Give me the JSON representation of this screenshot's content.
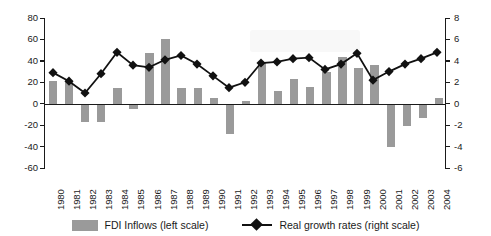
{
  "chart_data": {
    "type": "bar",
    "title": "",
    "subtitle": "",
    "xlabel": "",
    "ylabel": "",
    "grid": false,
    "legend_position": "bottom-center",
    "categories": [
      "1980",
      "1981",
      "1982",
      "1983",
      "1984",
      "1985",
      "1986",
      "1987",
      "1988",
      "1989",
      "1990",
      "1991",
      "1992",
      "1993",
      "1994",
      "1995",
      "1996",
      "1997",
      "1998",
      "1999",
      "2000",
      "2001",
      "2002",
      "2003",
      "2004"
    ],
    "axes": {
      "left": {
        "name": "FDI Inflows (left scale)",
        "ylim": [
          -60,
          80
        ],
        "ticks": [
          80,
          60,
          40,
          20,
          0,
          -20,
          -40,
          -60
        ],
        "tick_labels": [
          "80",
          "60",
          "40",
          "20",
          "0",
          "-20",
          "-40",
          "-60"
        ]
      },
      "right": {
        "name": "Real growth rates (right scale)",
        "ylim": [
          -6,
          8
        ],
        "ticks": [
          8,
          6,
          4,
          2,
          0,
          -2,
          -4,
          -6
        ],
        "tick_labels": [
          "8",
          "6",
          "4",
          "2",
          "0",
          "-2",
          "-4",
          "-6"
        ]
      }
    },
    "series": [
      {
        "name": "FDI Inflows (left scale)",
        "type": "bar",
        "axis": "left",
        "color": "#9a9a9a",
        "values": [
          21,
          20,
          -17,
          -17,
          15,
          -5,
          47,
          60,
          15,
          15,
          5,
          -28,
          3,
          38,
          12,
          23,
          16,
          30,
          44,
          33,
          36,
          -40,
          -21,
          -13,
          5
        ]
      },
      {
        "name": "Real growth rates (right scale)",
        "type": "line",
        "axis": "right",
        "color": "#111111",
        "marker": "diamond",
        "values": [
          2.9,
          2.1,
          1.0,
          2.8,
          4.8,
          3.6,
          3.4,
          4.1,
          4.5,
          3.7,
          2.6,
          1.5,
          2.0,
          3.8,
          3.9,
          4.2,
          4.3,
          3.2,
          3.7,
          4.7,
          2.2,
          3.0,
          3.7,
          4.2,
          4.8
        ]
      }
    ]
  },
  "legend": {
    "items": [
      {
        "label": "FDI Inflows (left scale)",
        "swatch": "bar-swatch",
        "color": "#9a9a9a"
      },
      {
        "label": "Real growth rates (right scale)",
        "swatch": "diamond-line-marker",
        "color": "#111111"
      }
    ]
  }
}
